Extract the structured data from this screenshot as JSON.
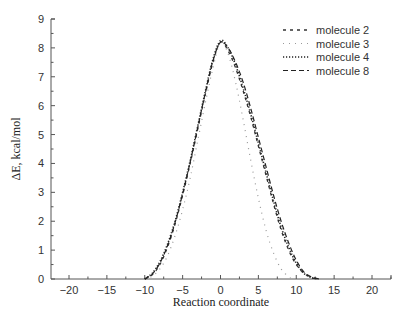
{
  "chart_data": {
    "type": "line",
    "title": "",
    "xlabel": "Reaction coordinate",
    "ylabel": "ΔE, kcal/mol",
    "xlim": [
      -23,
      23
    ],
    "ylim": [
      0,
      9
    ],
    "xticks": [
      -20,
      -15,
      -10,
      -5,
      0,
      5,
      10,
      15,
      20
    ],
    "yticks": [
      0,
      1,
      2,
      3,
      4,
      5,
      6,
      7,
      8,
      9
    ],
    "grid": false,
    "legend_position": "upper right",
    "series": [
      {
        "name": "molecule 2",
        "style": "dash-dot",
        "color": "#333333",
        "x": [
          -10,
          -9,
          -8,
          -7,
          -6,
          -5,
          -4,
          -3,
          -2,
          -1,
          0,
          1,
          2,
          3,
          4,
          5,
          6,
          7,
          8,
          9,
          10,
          11,
          12,
          12.8
        ],
        "y": [
          0.0,
          0.15,
          0.5,
          1.1,
          1.9,
          2.9,
          4.0,
          5.2,
          6.4,
          7.5,
          8.2,
          7.9,
          7.3,
          6.5,
          5.6,
          4.6,
          3.6,
          2.6,
          1.7,
          1.0,
          0.5,
          0.2,
          0.05,
          0.0
        ]
      },
      {
        "name": "molecule 3",
        "style": "sparse-dot",
        "color": "#888888",
        "x": [
          -10,
          -9,
          -8,
          -7,
          -6,
          -5,
          -4,
          -3,
          -2,
          -1,
          0,
          1,
          2,
          3,
          4,
          5,
          6,
          7,
          8,
          9,
          9.5
        ],
        "y": [
          0.0,
          0.1,
          0.35,
          0.8,
          1.5,
          2.4,
          3.5,
          4.8,
          6.1,
          7.3,
          8.2,
          7.8,
          6.8,
          5.5,
          4.1,
          2.8,
          1.7,
          0.9,
          0.35,
          0.08,
          0.0
        ]
      },
      {
        "name": "molecule 4",
        "style": "dotted",
        "color": "#222222",
        "x": [
          -10,
          -9,
          -8,
          -7,
          -6,
          -5,
          -4,
          -3,
          -2,
          -1,
          0,
          1,
          2,
          3,
          4,
          5,
          6,
          7,
          8,
          9,
          10,
          11,
          12,
          12.8
        ],
        "y": [
          0.0,
          0.2,
          0.6,
          1.2,
          2.0,
          3.0,
          4.1,
          5.3,
          6.5,
          7.6,
          8.25,
          8.0,
          7.4,
          6.6,
          5.7,
          4.7,
          3.7,
          2.7,
          1.8,
          1.1,
          0.55,
          0.2,
          0.05,
          0.0
        ]
      },
      {
        "name": "molecule 8",
        "style": "dashed",
        "color": "#222222",
        "x": [
          -10,
          -9,
          -8,
          -7,
          -6,
          -5,
          -4,
          -3,
          -2,
          -1,
          0,
          1,
          2,
          3,
          4,
          5,
          6,
          7,
          8,
          9,
          10,
          11,
          12,
          13
        ],
        "y": [
          0.0,
          0.18,
          0.55,
          1.15,
          1.95,
          2.95,
          4.05,
          5.25,
          6.45,
          7.55,
          8.2,
          8.0,
          7.5,
          6.8,
          5.9,
          4.9,
          3.9,
          2.9,
          2.0,
          1.25,
          0.65,
          0.25,
          0.07,
          0.0
        ]
      }
    ]
  }
}
